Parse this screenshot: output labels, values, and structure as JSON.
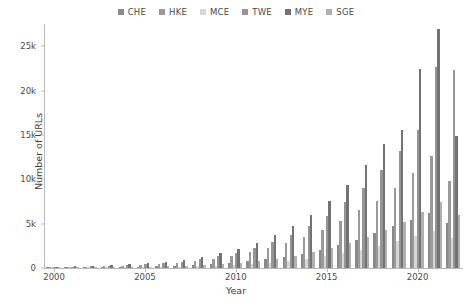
{
  "legend": {
    "position": "top-center",
    "entries": [
      {
        "label": "CHE",
        "color": "#8a8a8a"
      },
      {
        "label": "HKE",
        "color": "#9a9a9a"
      },
      {
        "label": "MCE",
        "color": "#d8d8d8"
      },
      {
        "label": "TWE",
        "color": "#959595"
      },
      {
        "label": "MYE",
        "color": "#737373"
      },
      {
        "label": "SGE",
        "color": "#b0b0b0"
      }
    ]
  },
  "axes": {
    "ylabel": "Number of URLs",
    "xlabel": "Year",
    "yticks": [
      "0",
      "5k",
      "10k",
      "15k",
      "20k",
      "25k"
    ],
    "ytick_values": [
      0,
      5000,
      10000,
      15000,
      20000,
      25000
    ],
    "xticks": [
      "2000",
      "2005",
      "2010",
      "2015",
      "2020"
    ],
    "xtick_values": [
      2000,
      2005,
      2010,
      2015,
      2020
    ]
  },
  "chart_data": {
    "type": "bar",
    "title": "",
    "xlabel": "Year",
    "ylabel": "Number of URLs",
    "ylim": [
      0,
      27500
    ],
    "xlim": [
      1999.5,
      2022.5
    ],
    "grid": false,
    "legend_position": "top-center",
    "categories": [
      2000,
      2001,
      2002,
      2003,
      2004,
      2005,
      2006,
      2007,
      2008,
      2009,
      2010,
      2011,
      2012,
      2013,
      2014,
      2015,
      2016,
      2017,
      2018,
      2019,
      2020,
      2021,
      2022
    ],
    "series": [
      {
        "name": "CHE",
        "color": "#8a8a8a",
        "values": [
          60,
          70,
          90,
          110,
          130,
          160,
          200,
          260,
          340,
          430,
          560,
          760,
          980,
          1250,
          1600,
          2050,
          2600,
          3150,
          3900,
          4700,
          5400,
          6200,
          5100
        ]
      },
      {
        "name": "HKE",
        "color": "#9a9a9a",
        "values": [
          90,
          110,
          140,
          180,
          230,
          300,
          420,
          560,
          760,
          1000,
          1350,
          1750,
          2200,
          2800,
          3500,
          4300,
          5300,
          6500,
          7600,
          9000,
          10700,
          12600,
          9800
        ]
      },
      {
        "name": "MCE",
        "color": "#d8d8d8",
        "values": [
          30,
          35,
          45,
          55,
          70,
          90,
          120,
          160,
          210,
          270,
          350,
          460,
          600,
          780,
          1000,
          1300,
          1650,
          2050,
          2500,
          3000,
          3600,
          4200,
          3400
        ]
      },
      {
        "name": "TWE",
        "color": "#959595",
        "values": [
          110,
          140,
          180,
          230,
          300,
          400,
          540,
          720,
          980,
          1300,
          1700,
          2250,
          2900,
          3700,
          4700,
          5900,
          7400,
          9000,
          11000,
          13200,
          15600,
          22600,
          22300
        ]
      },
      {
        "name": "MYE",
        "color": "#737373",
        "values": [
          150,
          190,
          240,
          310,
          400,
          520,
          700,
          940,
          1250,
          1650,
          2150,
          2850,
          3700,
          4700,
          6000,
          7500,
          9400,
          11600,
          14000,
          15600,
          22400,
          26900,
          14900
        ]
      },
      {
        "name": "SGE",
        "color": "#b0b0b0",
        "values": [
          45,
          55,
          70,
          90,
          115,
          150,
          200,
          265,
          350,
          460,
          600,
          800,
          1050,
          1350,
          1750,
          2250,
          2850,
          3500,
          4300,
          5200,
          6300,
          7400,
          6000
        ]
      }
    ]
  }
}
